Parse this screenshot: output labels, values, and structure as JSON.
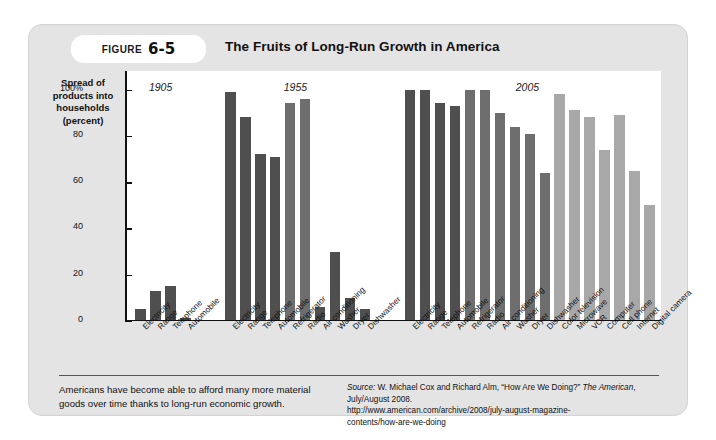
{
  "figure": {
    "badge_word": "Figure",
    "badge_number": "6-5",
    "title": "The Fruits of Long-Run Growth in America"
  },
  "axis": {
    "y_label_lines": [
      "Spread of",
      "products into",
      "households",
      "(percent)"
    ],
    "y_ticks": [
      "100%",
      "80",
      "60",
      "40",
      "20",
      "0"
    ],
    "y_tick_values": [
      100,
      80,
      60,
      40,
      20,
      0
    ],
    "ylim": [
      0,
      108
    ]
  },
  "footer": {
    "caption": "Americans have become able to afford many more material goods over time thanks to long-run economic growth.",
    "source_prefix": "Source:",
    "source_text_1": " W. Michael Cox and Richard Alm, “How Are We Doing?” ",
    "source_magazine": "The American",
    "source_text_2": ", July/August 2008.",
    "source_url_1": "http://www.american.com/archive/2008/july-august-magazine-",
    "source_url_2": "contents/how-are-we-doing"
  },
  "colors": {
    "card_bg": "#e4e4e4",
    "plot_bg": "#ffffff",
    "bar_dark": "#4f4f4f",
    "bar_mid": "#6e6e6e",
    "bar_light": "#a8a8a8",
    "axis": "#111111",
    "rule": "#555555"
  },
  "chart_data": {
    "type": "bar",
    "title": "The Fruits of Long-Run Growth in America",
    "xlabel": "",
    "ylabel": "Spread of products into households (percent)",
    "ylim": [
      0,
      108
    ],
    "grid": false,
    "legend": "none",
    "groups": [
      {
        "year": "1905",
        "categories": [
          "Electricity",
          "Range",
          "Telephone",
          "Automobile"
        ],
        "values": [
          5,
          13,
          15,
          1.5
        ],
        "shades": [
          "dark",
          "dark",
          "dark",
          "dark"
        ]
      },
      {
        "year": "1955",
        "categories": [
          "Electricity",
          "Range",
          "Telephone",
          "Automobile",
          "Refrigerator",
          "Radio",
          "Air conditioning",
          "Washer",
          "Dryer",
          "Dishwasher"
        ],
        "values": [
          99,
          88,
          72,
          71,
          94,
          96,
          6,
          30,
          10,
          5
        ],
        "shades": [
          "dark",
          "dark",
          "dark",
          "dark",
          "mid",
          "mid",
          "dark",
          "dark",
          "dark",
          "dark"
        ]
      },
      {
        "year": "2005",
        "categories": [
          "Electricity",
          "Range",
          "Telephone",
          "Automobile",
          "Refrigerator",
          "Radio",
          "Air conditioning",
          "Washer",
          "Dryer",
          "Dishwasher",
          "Color television",
          "Microwave",
          "VCR",
          "Computer",
          "Cell phone",
          "Internet",
          "Digital camera"
        ],
        "values": [
          100,
          100,
          94,
          93,
          100,
          100,
          90,
          84,
          81,
          64,
          98,
          91,
          88,
          74,
          89,
          65,
          50
        ],
        "shades": [
          "dark",
          "dark",
          "dark",
          "dark",
          "mid",
          "mid",
          "mid",
          "mid",
          "mid",
          "mid",
          "light",
          "light",
          "light",
          "light",
          "light",
          "light",
          "light"
        ]
      }
    ]
  }
}
